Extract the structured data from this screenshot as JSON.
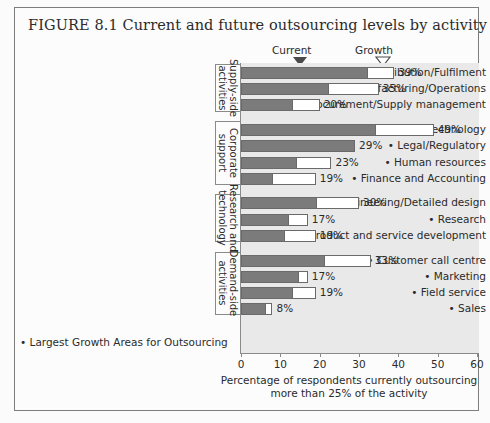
{
  "figure": {
    "number": "FIGURE 8.1",
    "title": "Current and future outsourcing levels by activity"
  },
  "legend": {
    "current_label": "Current",
    "growth_label": "Growth"
  },
  "footnote": "• Largest Growth Areas for Outsourcing",
  "chart_data": {
    "type": "bar",
    "orientation": "horizontal",
    "stacked": true,
    "title": "Current and future outsourcing levels by activity",
    "xlabel": "Percentage of respondents currently outsourcing more than 25% of the activity",
    "ylabel": "",
    "xlim": [
      0,
      60
    ],
    "xticks": [
      0,
      10,
      20,
      30,
      40,
      50,
      60
    ],
    "grid": false,
    "legend_position": "top",
    "series": [
      {
        "name": "Current",
        "color": "#7b7b7b"
      },
      {
        "name": "Growth",
        "color": "#ffffff"
      }
    ],
    "marker_current_value": 15,
    "marker_growth_value": 36,
    "groups": [
      {
        "name": "Supply-side activities",
        "categories": [
          {
            "label": "Distribution/Fulfilment",
            "bullet": false,
            "current": 32,
            "total": 39,
            "value_label": "39%"
          },
          {
            "label": "Manufacturing/Operations",
            "bullet": true,
            "current": 22,
            "total": 35,
            "value_label": "35%"
          },
          {
            "label": "Procurement/Supply management",
            "bullet": true,
            "current": 13,
            "total": 20,
            "value_label": "20%"
          }
        ]
      },
      {
        "name": "Corporate support",
        "categories": [
          {
            "label": "Information technology",
            "bullet": true,
            "current": 34,
            "total": 49,
            "value_label": "49%"
          },
          {
            "label": "Legal/Regulatory",
            "bullet": true,
            "current": 29,
            "total": 29,
            "value_label": "29%"
          },
          {
            "label": "Human resources",
            "bullet": true,
            "current": 14,
            "total": 23,
            "value_label": "23%"
          },
          {
            "label": "Finance and Accounting",
            "bullet": true,
            "current": 8,
            "total": 19,
            "value_label": "19%"
          }
        ]
      },
      {
        "name": "Research and technology",
        "categories": [
          {
            "label": "Engineering/Detailed design",
            "bullet": true,
            "current": 19,
            "total": 30,
            "value_label": "30%"
          },
          {
            "label": "Research",
            "bullet": true,
            "current": 12,
            "total": 17,
            "value_label": "17%"
          },
          {
            "label": "Product and service development",
            "bullet": true,
            "current": 11,
            "total": 19,
            "value_label": "19%"
          }
        ]
      },
      {
        "name": "Demand-side activities",
        "categories": [
          {
            "label": "Customer call centre",
            "bullet": true,
            "current": 21,
            "total": 33,
            "value_label": "33%"
          },
          {
            "label": "Marketing",
            "bullet": true,
            "current": 14.5,
            "total": 17,
            "value_label": "17%"
          },
          {
            "label": "Field service",
            "bullet": true,
            "current": 13,
            "total": 19,
            "value_label": "19%"
          },
          {
            "label": "Sales",
            "bullet": true,
            "current": 6,
            "total": 8,
            "value_label": "8%"
          }
        ]
      }
    ]
  }
}
